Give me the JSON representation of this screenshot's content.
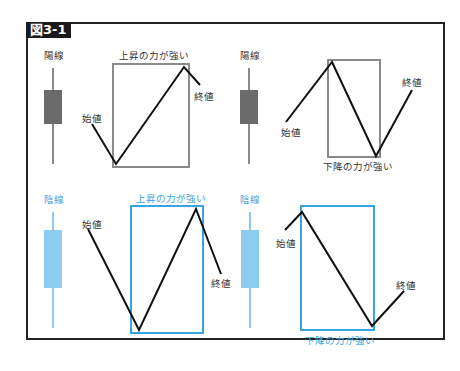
{
  "figure": {
    "title": "図3-1",
    "colors": {
      "bullish_body": "#6b6b6b",
      "bullish_box": "#8a8a8a",
      "bearish_body": "#8ecbf2",
      "bearish_box": "#3aa4e0",
      "price_line": "#111111"
    },
    "panels": [
      {
        "id": "top-left",
        "candle_label": "陽線",
        "box_label": "上昇の力が強い",
        "open_label": "始値",
        "close_label": "終値"
      },
      {
        "id": "top-right",
        "candle_label": "陽線",
        "box_label": "下降の力が強い",
        "open_label": "始値",
        "close_label": "終値"
      },
      {
        "id": "bottom-left",
        "candle_label": "陰線",
        "box_label": "上昇の力が強い",
        "open_label": "始値",
        "close_label": "終値"
      },
      {
        "id": "bottom-right",
        "candle_label": "陰線",
        "box_label": "下降の力が強い",
        "open_label": "始値",
        "close_label": "終値"
      }
    ]
  }
}
